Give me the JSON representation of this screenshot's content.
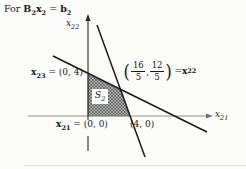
{
  "figure": {
    "title": {
      "prefix": "For ",
      "m1": "B",
      "s1": "2",
      "m2": "x",
      "s2": "2",
      "eq": " = ",
      "m3": "b",
      "s3": "2"
    },
    "axes": {
      "vertical": {
        "base": "x",
        "sub": "22"
      },
      "horizontal": {
        "base": "x",
        "sub": "21"
      }
    },
    "points": {
      "x23": {
        "vec": "x",
        "sub": "23",
        "rest": " = (0, 4)"
      },
      "origin": {
        "vec": "x",
        "sub": "21",
        "rest": " = (0, 0)"
      },
      "x40": {
        "text": "(4, 0)"
      },
      "x22": {
        "open": "(",
        "f1_num": "16",
        "f1_den": "5",
        "comma": ",",
        "f2_num": "12",
        "f2_den": "5",
        "close": ")",
        "eq": " = ",
        "vec": "x",
        "sub": "22"
      }
    },
    "region": {
      "base": "S",
      "sub": "2"
    },
    "colors": {
      "ink": "#1a1a1a",
      "axis_gray": "#8f8f8f",
      "hatch": "#3d3d3d",
      "hatch_bg": "#c9c9c7",
      "background": "#fcfcfa"
    }
  }
}
